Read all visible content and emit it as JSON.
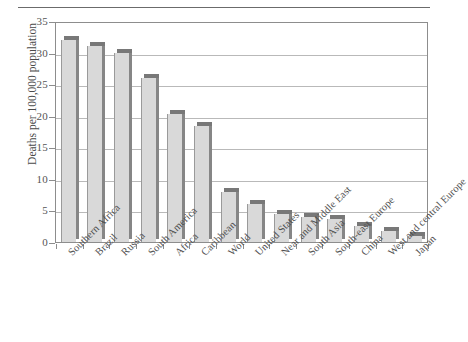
{
  "chart_data": {
    "type": "bar",
    "title": "",
    "subtitle": "",
    "xlabel": "",
    "ylabel": "Deaths per 100,000 population",
    "ylim": [
      0,
      35
    ],
    "yticks": [
      0,
      5,
      10,
      15,
      20,
      25,
      30,
      35
    ],
    "ytick_labels": [
      "0",
      "5",
      "10",
      "15",
      "20",
      "25",
      "30",
      "35"
    ],
    "grid": true,
    "legend": "none",
    "orientation": "vertical",
    "bar_style": "3d-shaded",
    "categories": [
      "Southern Africa",
      "Brazil",
      "Russia",
      "South America",
      "Africa",
      "Caribbean",
      "World",
      "United States",
      "Near and Middle East",
      "South Asia",
      "South-east Europe",
      "China",
      "West and central Europe",
      "Japan"
    ],
    "values": [
      32.0,
      31.0,
      30.0,
      26.0,
      20.3,
      18.3,
      8.0,
      6.0,
      4.5,
      4.0,
      3.7,
      2.5,
      1.7,
      1.0
    ],
    "series": [
      {
        "name": "Homicide rate",
        "values": [
          32.0,
          31.0,
          30.0,
          26.0,
          20.3,
          18.3,
          8.0,
          6.0,
          4.5,
          4.0,
          3.7,
          2.5,
          1.7,
          1.0
        ]
      }
    ],
    "colors": {
      "bar_front": "#d9d9d9",
      "bar_top": "#787878",
      "bar_side": "#868686",
      "gridline": "#b9b9b9",
      "axis": "#8d8d8d",
      "text": "#4a4a4a",
      "rule": "#6b6b6b"
    }
  }
}
